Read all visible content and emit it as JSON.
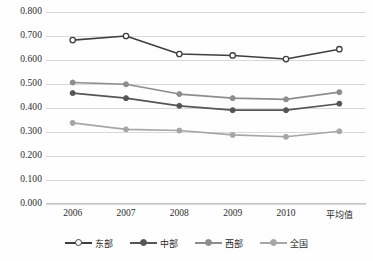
{
  "chart_data": {
    "type": "line",
    "title": "",
    "xlabel": "",
    "ylabel": "",
    "categories": [
      "2006",
      "2007",
      "2008",
      "2009",
      "2010",
      "平均值"
    ],
    "ylim": [
      0.0,
      0.8
    ],
    "ytick_step": 0.1,
    "ytick_labels": [
      "0.800",
      "0.700",
      "0.600",
      "0.500",
      "0.400",
      "0.300",
      "0.200",
      "0.100",
      "0.000"
    ],
    "ytick_values": [
      0.8,
      0.7,
      0.6,
      0.5,
      0.4,
      0.3,
      0.2,
      0.1,
      0.0
    ],
    "grid": true,
    "grid_axis": "y",
    "legend_position": "bottom",
    "series": [
      {
        "name": "东部",
        "values": [
          0.683,
          0.7,
          0.625,
          0.619,
          0.604,
          0.645
        ],
        "color": "#3f3f3f",
        "marker": "circle-open",
        "marker_fill": "#ffffff"
      },
      {
        "name": "中部",
        "values": [
          0.462,
          0.441,
          0.409,
          0.391,
          0.391,
          0.418
        ],
        "color": "#555555",
        "marker": "circle-filled",
        "marker_fill": "#555555"
      },
      {
        "name": "西部",
        "values": [
          0.506,
          0.499,
          0.458,
          0.441,
          0.436,
          0.466
        ],
        "color": "#8d8d8d",
        "marker": "circle-filled",
        "marker_fill": "#8d8d8d"
      },
      {
        "name": "全国",
        "values": [
          0.338,
          0.311,
          0.306,
          0.288,
          0.28,
          0.303
        ],
        "color": "#a6a6a6",
        "marker": "circle-filled",
        "marker_fill": "#a6a6a6"
      }
    ]
  },
  "colors": {
    "gridline": "#d9d9d9",
    "axis": "#c4c4c4",
    "text": "#2b2b2b",
    "background": "#fefefe"
  }
}
